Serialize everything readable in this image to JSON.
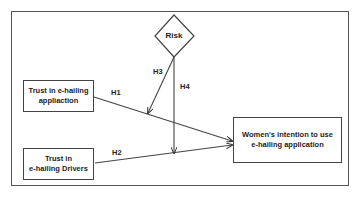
{
  "diagram": {
    "nodes": {
      "risk": {
        "label": "Risk",
        "shape": "diamond"
      },
      "trust_app": {
        "label": "Trust in e-hailing appliaction",
        "line1": "Trust in e-hailing",
        "line2": "appliaction"
      },
      "trust_drivers": {
        "label": "Trust in e-hailing Drivers",
        "line1": "Trust in",
        "line2": "e-hailing Drivers"
      },
      "intention": {
        "label": "Women's intention to use e-hailing application",
        "line1": "Women's intention to use",
        "line2": "e-hailing application"
      }
    },
    "edges": [
      {
        "id": "H1",
        "label": "H1",
        "from": "trust_app",
        "to": "intention"
      },
      {
        "id": "H2",
        "label": "H2",
        "from": "trust_drivers",
        "to": "intention"
      },
      {
        "id": "H3",
        "label": "H3",
        "from": "risk",
        "to": "H1",
        "type": "moderation"
      },
      {
        "id": "H4",
        "label": "H4",
        "from": "risk",
        "to": "H2",
        "type": "moderation"
      }
    ],
    "colors": {
      "line": "#444444",
      "text": "#222222",
      "background": "#ffffff"
    }
  }
}
